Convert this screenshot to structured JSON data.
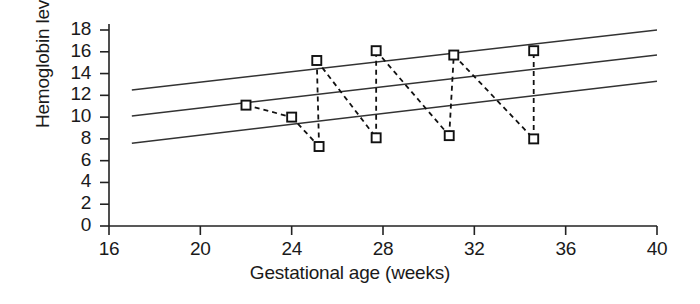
{
  "chart_data": {
    "type": "scatter",
    "title": "",
    "xlabel": "Gestational age (weeks)",
    "ylabel": "Hemoglobin level (g/dL)",
    "xlim": [
      16,
      40
    ],
    "ylim": [
      0,
      18
    ],
    "xticks": [
      16,
      20,
      24,
      28,
      32,
      36,
      40
    ],
    "yticks": [
      0,
      2,
      4,
      6,
      8,
      10,
      12,
      14,
      16,
      18
    ],
    "grid": false,
    "legend": null,
    "series": [
      {
        "name": "Patient hemoglobin measurements",
        "marker": "open-square",
        "linestyle": "dashed",
        "x": [
          22.0,
          24.0,
          25.1,
          25.2,
          27.7,
          27.7,
          31.1,
          30.9,
          34.6,
          34.6
        ],
        "y": [
          11.1,
          10.0,
          15.2,
          7.3,
          16.1,
          8.1,
          15.7,
          8.3,
          16.1,
          8.0
        ]
      }
    ],
    "connections": [
      [
        0,
        1
      ],
      [
        1,
        3
      ],
      [
        3,
        2
      ],
      [
        2,
        5
      ],
      [
        5,
        4
      ],
      [
        4,
        7
      ],
      [
        7,
        6
      ],
      [
        6,
        9
      ],
      [
        9,
        8
      ]
    ],
    "reference_lines": [
      {
        "name": "upper-reference-line",
        "x": [
          17.0,
          40.0
        ],
        "y": [
          12.5,
          18.0
        ],
        "linestyle": "solid"
      },
      {
        "name": "middle-reference-line",
        "x": [
          17.0,
          40.0
        ],
        "y": [
          10.1,
          15.7
        ],
        "linestyle": "solid"
      },
      {
        "name": "lower-reference-line",
        "x": [
          17.0,
          40.0
        ],
        "y": [
          7.6,
          13.3
        ],
        "linestyle": "solid"
      }
    ],
    "colors": {
      "axis": "#222222",
      "marker": "#111111",
      "dashed": "#111111",
      "reference": "#333333",
      "background": "#ffffff"
    }
  }
}
